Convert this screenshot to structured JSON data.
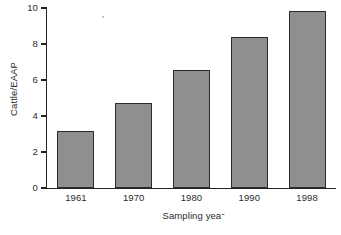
{
  "chart_data": {
    "type": "bar",
    "title": "",
    "subtitle": "",
    "categories": [
      "1961",
      "1970",
      "1980",
      "1990",
      "1998"
    ],
    "values": [
      3.15,
      4.7,
      6.55,
      8.4,
      9.85
    ],
    "series": [
      {
        "name": "Cattle/EAAP",
        "values": [
          3.15,
          4.7,
          6.55,
          8.4,
          9.85
        ]
      }
    ],
    "xlabel": "Sampling year",
    "ylabel": "Cattle/EAAP",
    "xlim": [
      0,
      5
    ],
    "ylim": [
      0,
      10
    ],
    "yticks": [
      "0",
      "2",
      "4",
      "6",
      "8",
      "10"
    ],
    "ytick_values": [
      0,
      2,
      4,
      6,
      8,
      10
    ],
    "xticks": [
      "1961",
      "1970",
      "1980",
      "1990",
      "1998"
    ],
    "grid": false,
    "legend": false,
    "legend_position": "none",
    "annotations": [],
    "colors": {
      "bar_fill": "#8f8f8f",
      "bar_edge": "#2c2c2c",
      "axis": "#242424",
      "text": "#2b2b2b",
      "background": "#ffffff"
    }
  },
  "axes": {
    "y": {
      "title": "Cattle/EAAP",
      "ticks": [
        {
          "label": "10",
          "value": 10
        },
        {
          "label": "8",
          "value": 8
        },
        {
          "label": "6",
          "value": 6
        },
        {
          "label": "4",
          "value": 4
        },
        {
          "label": "2",
          "value": 2
        },
        {
          "label": "0",
          "value": 0
        }
      ]
    },
    "x": {
      "title_visible": "Sampling yea",
      "title_truncated_char": "r",
      "title_full": "Sampling year",
      "ticks": [
        {
          "label": "1961"
        },
        {
          "label": "1970"
        },
        {
          "label": "1980"
        },
        {
          "label": "1990"
        },
        {
          "label": "1998"
        }
      ]
    }
  },
  "bars": [
    {
      "category": "1961",
      "value": 3.15
    },
    {
      "category": "1970",
      "value": 4.7
    },
    {
      "category": "1980",
      "value": 6.55
    },
    {
      "category": "1990",
      "value": 8.4
    },
    {
      "category": "1998",
      "value": 9.85
    }
  ]
}
